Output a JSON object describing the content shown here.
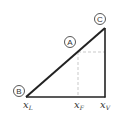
{
  "diagram": {
    "points": {
      "A": {
        "label": "A"
      },
      "B": {
        "label": "B"
      },
      "C": {
        "label": "C"
      }
    },
    "axis_labels": [
      {
        "base": "x",
        "sub": "L"
      },
      {
        "base": "x",
        "sub": "F"
      },
      {
        "base": "x",
        "sub": "V"
      }
    ],
    "colors": {
      "line": "#222222",
      "dashed": "#bbbbbb",
      "circle": "#444444"
    }
  }
}
